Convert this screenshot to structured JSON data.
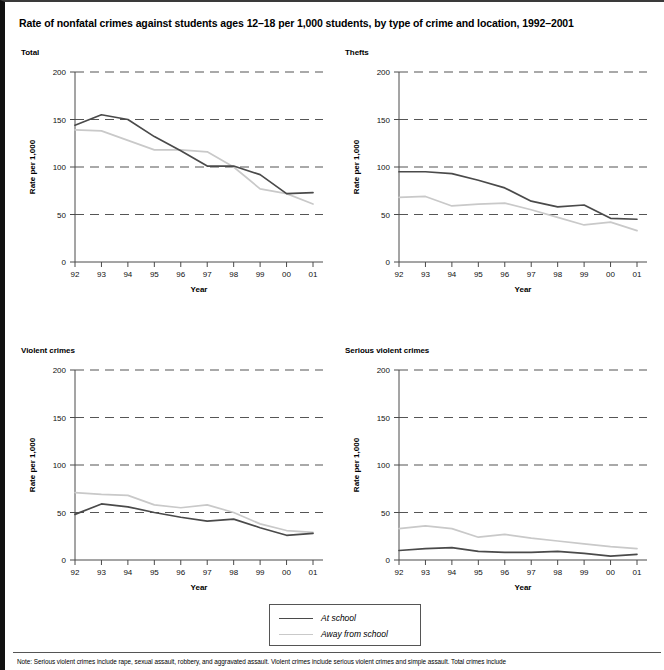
{
  "figure": {
    "title": "Rate of nonfatal crimes against students ages 12–18 per 1,000 students, by type of crime and location, 1992–2001",
    "note": "Note: Serious violent crimes include rape, sexual assault, robbery, and aggravated assault. Violent crimes include serious violent crimes and simple assault. Total crimes include"
  },
  "legend": {
    "items": [
      {
        "label": "At school",
        "color": "#4a4a4a"
      },
      {
        "label": "Away from school",
        "color": "#c9c9c9"
      }
    ]
  },
  "colors": {
    "at_school": "#4a4a4a",
    "away_from_school": "#c9c9c9",
    "grid": "#555555",
    "axis": "#4a4a4a"
  },
  "chart_data": [
    {
      "type": "line",
      "title": "Total",
      "xlabel": "Year",
      "ylabel": "Rate per 1,000",
      "categories": [
        "92",
        "93",
        "94",
        "95",
        "96",
        "97",
        "98",
        "99",
        "00",
        "01"
      ],
      "xticklabels": [
        "92",
        "93",
        "94",
        "95",
        "96",
        "97",
        "98",
        "99",
        "00",
        "01"
      ],
      "yticks": [
        0,
        50,
        100,
        150,
        200
      ],
      "ylim": [
        0,
        200
      ],
      "gridlines": [
        50,
        100,
        150,
        200
      ],
      "grid": true,
      "legend_position": "below-figure",
      "series": [
        {
          "name": "At school",
          "color": "#4a4a4a",
          "values": [
            144,
            155,
            150,
            132,
            117,
            101,
            101,
            92,
            72,
            73
          ]
        },
        {
          "name": "Away from school",
          "color": "#c9c9c9",
          "values": [
            139,
            138,
            128,
            118,
            118,
            116,
            100,
            77,
            72,
            61
          ]
        }
      ]
    },
    {
      "type": "line",
      "title": "Thefts",
      "xlabel": "Year",
      "ylabel": "Rate per 1,000",
      "categories": [
        "92",
        "93",
        "94",
        "95",
        "96",
        "97",
        "98",
        "99",
        "00",
        "01"
      ],
      "xticklabels": [
        "92",
        "93",
        "94",
        "95",
        "96",
        "97",
        "98",
        "99",
        "00",
        "01"
      ],
      "yticks": [
        0,
        50,
        100,
        150,
        200
      ],
      "ylim": [
        0,
        200
      ],
      "gridlines": [
        50,
        100,
        150,
        200
      ],
      "grid": true,
      "legend_position": "below-figure",
      "series": [
        {
          "name": "At school",
          "color": "#4a4a4a",
          "values": [
            95,
            95,
            93,
            86,
            78,
            64,
            58,
            60,
            46,
            45
          ]
        },
        {
          "name": "Away from school",
          "color": "#c9c9c9",
          "values": [
            68,
            69,
            59,
            61,
            62,
            55,
            47,
            39,
            42,
            33
          ]
        }
      ]
    },
    {
      "type": "line",
      "title": "Violent crimes",
      "xlabel": "Year",
      "ylabel": "Rate per 1,000",
      "categories": [
        "92",
        "93",
        "94",
        "95",
        "96",
        "97",
        "98",
        "99",
        "00",
        "01"
      ],
      "xticklabels": [
        "92",
        "93",
        "94",
        "95",
        "96",
        "97",
        "98",
        "99",
        "00",
        "01"
      ],
      "yticks": [
        0,
        50,
        100,
        150,
        200
      ],
      "ylim": [
        0,
        200
      ],
      "gridlines": [
        50,
        100,
        150,
        200
      ],
      "grid": true,
      "legend_position": "below-figure",
      "series": [
        {
          "name": "At school",
          "color": "#4a4a4a",
          "values": [
            48,
            59,
            56,
            50,
            45,
            41,
            43,
            34,
            26,
            28
          ]
        },
        {
          "name": "Away from school",
          "color": "#c9c9c9",
          "values": [
            71,
            69,
            68,
            58,
            55,
            58,
            50,
            38,
            31,
            29
          ]
        }
      ]
    },
    {
      "type": "line",
      "title": "Serious violent crimes",
      "xlabel": "Year",
      "ylabel": "Rate per 1,000",
      "categories": [
        "92",
        "93",
        "94",
        "95",
        "96",
        "97",
        "98",
        "99",
        "00",
        "01"
      ],
      "xticklabels": [
        "92",
        "93",
        "94",
        "95",
        "96",
        "97",
        "98",
        "99",
        "00",
        "01"
      ],
      "yticks": [
        0,
        50,
        100,
        150,
        200
      ],
      "ylim": [
        0,
        200
      ],
      "gridlines": [
        50,
        100,
        150,
        200
      ],
      "grid": true,
      "legend_position": "below-figure",
      "series": [
        {
          "name": "At school",
          "color": "#4a4a4a",
          "values": [
            10,
            12,
            13,
            9,
            8,
            8,
            9,
            7,
            4,
            6
          ]
        },
        {
          "name": "Away from school",
          "color": "#c9c9c9",
          "values": [
            33,
            36,
            33,
            24,
            27,
            23,
            20,
            17,
            14,
            12
          ]
        }
      ]
    }
  ]
}
